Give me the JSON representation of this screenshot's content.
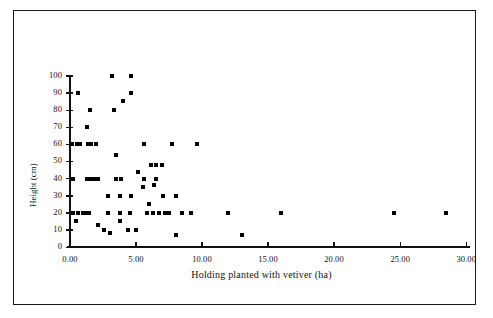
{
  "figure": {
    "border": true,
    "background": "#ffffff",
    "marker_color": "#000000",
    "axis_color": "#111111"
  },
  "chart_data": {
    "type": "scatter",
    "title": "",
    "xlabel": "Holding planted with vetiver (ha)",
    "ylabel": "Height (cm)",
    "xlim": [
      0,
      30
    ],
    "ylim": [
      0,
      100
    ],
    "x_ticks": [
      0,
      5,
      10,
      15,
      20,
      25,
      30
    ],
    "x_tick_labels": [
      "0.00",
      "5.00",
      "10.00",
      "15.00",
      "20.00",
      "25.00",
      "30.00"
    ],
    "y_ticks": [
      0,
      10,
      20,
      30,
      40,
      50,
      60,
      70,
      80,
      90,
      100
    ],
    "y_tick_labels": [
      "0",
      "10",
      "20",
      "30",
      "40",
      "50",
      "60",
      "70",
      "80",
      "90",
      "100"
    ],
    "axis_break": {
      "present": true,
      "between": [
        20.8,
        22.3
      ]
    },
    "grid": false,
    "legend": null,
    "marker": "square",
    "points": [
      {
        "x": 0.15,
        "y": 60
      },
      {
        "x": 0.55,
        "y": 60
      },
      {
        "x": 0.75,
        "y": 60
      },
      {
        "x": 1.35,
        "y": 60
      },
      {
        "x": 1.6,
        "y": 60
      },
      {
        "x": 1.95,
        "y": 60
      },
      {
        "x": 0.6,
        "y": 90
      },
      {
        "x": 1.5,
        "y": 80
      },
      {
        "x": 1.25,
        "y": 70
      },
      {
        "x": 0.2,
        "y": 40
      },
      {
        "x": 1.3,
        "y": 40
      },
      {
        "x": 1.6,
        "y": 40
      },
      {
        "x": 1.9,
        "y": 40
      },
      {
        "x": 2.15,
        "y": 40
      },
      {
        "x": 0.2,
        "y": 20
      },
      {
        "x": 0.6,
        "y": 20
      },
      {
        "x": 0.95,
        "y": 20
      },
      {
        "x": 1.15,
        "y": 20
      },
      {
        "x": 0.45,
        "y": 15
      },
      {
        "x": 1.45,
        "y": 20
      },
      {
        "x": 2.15,
        "y": 13
      },
      {
        "x": 2.6,
        "y": 10
      },
      {
        "x": 3.05,
        "y": 8
      },
      {
        "x": 3.2,
        "y": 100
      },
      {
        "x": 4.6,
        "y": 100
      },
      {
        "x": 4.0,
        "y": 85
      },
      {
        "x": 4.6,
        "y": 90
      },
      {
        "x": 3.3,
        "y": 80
      },
      {
        "x": 5.6,
        "y": 60
      },
      {
        "x": 7.75,
        "y": 60
      },
      {
        "x": 3.45,
        "y": 54
      },
      {
        "x": 9.6,
        "y": 60
      },
      {
        "x": 6.1,
        "y": 48
      },
      {
        "x": 6.55,
        "y": 48
      },
      {
        "x": 6.95,
        "y": 48
      },
      {
        "x": 3.45,
        "y": 40
      },
      {
        "x": 3.9,
        "y": 40
      },
      {
        "x": 5.15,
        "y": 44
      },
      {
        "x": 5.6,
        "y": 40
      },
      {
        "x": 6.5,
        "y": 40
      },
      {
        "x": 5.5,
        "y": 35
      },
      {
        "x": 6.35,
        "y": 36
      },
      {
        "x": 2.9,
        "y": 30
      },
      {
        "x": 3.75,
        "y": 30
      },
      {
        "x": 4.6,
        "y": 30
      },
      {
        "x": 7.05,
        "y": 30
      },
      {
        "x": 6.0,
        "y": 25
      },
      {
        "x": 2.85,
        "y": 20
      },
      {
        "x": 3.75,
        "y": 20
      },
      {
        "x": 4.55,
        "y": 20
      },
      {
        "x": 5.85,
        "y": 20
      },
      {
        "x": 6.3,
        "y": 20
      },
      {
        "x": 6.75,
        "y": 20
      },
      {
        "x": 7.2,
        "y": 20
      },
      {
        "x": 7.5,
        "y": 20
      },
      {
        "x": 8.05,
        "y": 30
      },
      {
        "x": 8.5,
        "y": 20
      },
      {
        "x": 9.2,
        "y": 20
      },
      {
        "x": 3.75,
        "y": 15
      },
      {
        "x": 4.4,
        "y": 10
      },
      {
        "x": 5.0,
        "y": 10
      },
      {
        "x": 8.0,
        "y": 7
      },
      {
        "x": 12.0,
        "y": 20
      },
      {
        "x": 13.0,
        "y": 7
      },
      {
        "x": 16.0,
        "y": 20
      },
      {
        "x": 24.5,
        "y": 20
      },
      {
        "x": 28.5,
        "y": 20
      }
    ]
  },
  "axes_geometry": {
    "x0_px": 70,
    "x_unit_px": 13.2,
    "y0_px": 247,
    "y_unit_px": 1.712,
    "break_gap_px": 20
  }
}
